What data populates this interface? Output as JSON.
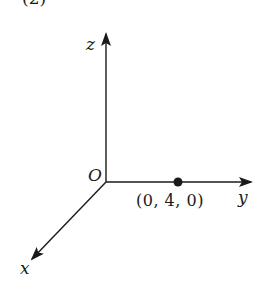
{
  "figure": {
    "panel_label": "(2)",
    "axes": {
      "z_label": "z",
      "y_label": "y",
      "x_label": "x",
      "origin_label": "O"
    },
    "point": {
      "label": "(0, 4, 0)",
      "coords": [
        0,
        4,
        0
      ]
    },
    "colors": {
      "ink": "#1a1a1a",
      "background": "#ffffff"
    }
  }
}
